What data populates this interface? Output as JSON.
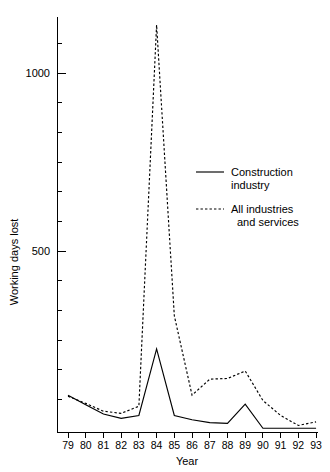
{
  "chart_data": {
    "type": "line",
    "title": "",
    "xlabel": "Year",
    "ylabel": "Working days lost",
    "x": [
      79,
      80,
      81,
      82,
      83,
      84,
      85,
      86,
      87,
      88,
      89,
      90,
      91,
      92,
      93
    ],
    "categories": [
      "79",
      "80",
      "81",
      "82",
      "83",
      "84",
      "85",
      "86",
      "87",
      "88",
      "89",
      "90",
      "91",
      "92",
      "93"
    ],
    "series": [
      {
        "name": "Construction industry",
        "style": "solid",
        "values": [
          95,
          68,
          42,
          30,
          38,
          225,
          38,
          26,
          18,
          16,
          70,
          2,
          2,
          2,
          2
        ]
      },
      {
        "name": "All industries and services",
        "style": "dashed",
        "values": [
          92,
          72,
          50,
          44,
          64,
          1135,
          318,
          95,
          140,
          142,
          163,
          80,
          38,
          10,
          20
        ]
      }
    ],
    "ylim": [
      0,
      1180
    ],
    "xlim": [
      78.4,
      93.6
    ],
    "y_major_ticks": [
      500,
      1000
    ],
    "y_minor_tick_count": 11,
    "y_tick_labels": [
      "500",
      "1000"
    ],
    "grid": false,
    "legend_position": "inside-right"
  },
  "axes": {
    "y_label": "Working days lost",
    "x_label": "Year",
    "y_tick_1000": "1000",
    "y_tick_500": "500"
  },
  "legend": {
    "entries": [
      {
        "line1": "Construction",
        "line2": "industry",
        "style": "solid"
      },
      {
        "line1": "All industries",
        "line2": "and services",
        "style": "dashed"
      }
    ]
  }
}
